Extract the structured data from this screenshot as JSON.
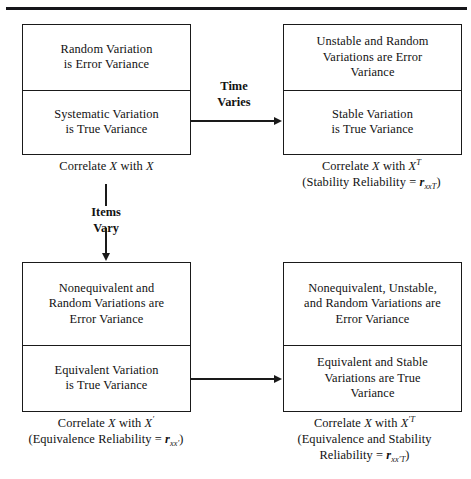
{
  "figure": {
    "type": "flow-diagram",
    "rule_color": "#16161a",
    "line_color": "#1a1a1a",
    "background": "#ffffff"
  },
  "boxes": {
    "top_left": {
      "name": "internal-consistency-same-form",
      "error_cell": "Random Variation\nis Error Variance",
      "error_cell_line1": "Random Variation",
      "error_cell_line2": "is Error Variance",
      "true_cell_line1": "Systematic Variation",
      "true_cell_line2": "is True Variance"
    },
    "top_right": {
      "name": "stability-retest",
      "error_cell_line1": "Unstable and Random",
      "error_cell_line2": "Variations are Error",
      "error_cell_line3": "Variance",
      "true_cell_line1": "Stable Variation",
      "true_cell_line2": "is True Variance"
    },
    "bottom_left": {
      "name": "equivalence-alternate-form",
      "error_cell_line1": "Nonequivalent and",
      "error_cell_line2": "Random Variations are",
      "error_cell_line3": "Error Variance",
      "true_cell_line1": "Equivalent Variation",
      "true_cell_line2": "is True Variance"
    },
    "bottom_right": {
      "name": "equivalence-and-stability",
      "error_cell_line1": "Nonequivalent, Unstable,",
      "error_cell_line2": "and Random Variations are",
      "error_cell_line3": "Error Variance",
      "true_cell_line1": "Equivalent and Stable",
      "true_cell_line2": "Variations are True",
      "true_cell_line3": "Variance"
    }
  },
  "captions": {
    "top_left": {
      "line1_prefix": "Correlate ",
      "line1_var1": "X",
      "line1_mid": " with ",
      "line1_var2": "X"
    },
    "top_right": {
      "line1_prefix": "Correlate ",
      "line1_var1": "X",
      "line1_mid": " with ",
      "line1_var2": "X",
      "line1_var2_sup": "T",
      "line2_prefix": "(Stability Reliability = ",
      "line2_r": "r",
      "line2_sub": "xx",
      "line2_sub_sup": "T",
      "line2_suffix": ")"
    },
    "bottom_left": {
      "line1_prefix": "Correlate ",
      "line1_var1": "X",
      "line1_mid": " with ",
      "line1_var2": "X",
      "line1_var2_prime": "′",
      "line2_prefix": "(Equivalence Reliability = ",
      "line2_r": "r",
      "line2_sub": "xx",
      "line2_sub_prime": "′",
      "line2_suffix": ")"
    },
    "bottom_right": {
      "line1_prefix": "Correlate ",
      "line1_var1": "X",
      "line1_mid": " with ",
      "line1_var2": "X",
      "line1_var2_prime": "′",
      "line1_var2_sup": "T",
      "line2": "(Equivalence and Stability",
      "line3_prefix": "Reliability = ",
      "line3_r": "r",
      "line3_sub": "xx",
      "line3_sub_prime": "′",
      "line3_sub_sup": "T",
      "line3_suffix": ")"
    }
  },
  "connectors": {
    "time": {
      "label_line1": "Time",
      "label_line2": "Varies",
      "direction": "left-to-right"
    },
    "items": {
      "label_line1": "Items",
      "label_line2": "Vary",
      "direction": "top-to-bottom"
    },
    "bottom": {
      "label_line1": "",
      "direction": "left-to-right"
    }
  }
}
